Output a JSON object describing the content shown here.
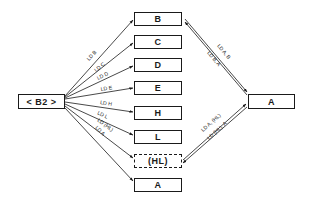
{
  "diagram": {
    "source": {
      "label": "< B2 >"
    },
    "targets": [
      {
        "label": "B",
        "edge_label": "LD B"
      },
      {
        "label": "C",
        "edge_label": "LD C"
      },
      {
        "label": "D",
        "edge_label": "LD D"
      },
      {
        "label": "E",
        "edge_label": "LD E"
      },
      {
        "label": "H",
        "edge_label": "LD H"
      },
      {
        "label": "L",
        "edge_label": "LD L"
      },
      {
        "label": "(HL)",
        "edge_label": "LD (HL)",
        "style": "dashed"
      },
      {
        "label": "A",
        "edge_label": "LD A"
      }
    ],
    "accumulator": {
      "label": "A"
    },
    "bidirectional_links": [
      {
        "between": [
          "B",
          "A"
        ],
        "labels": [
          "LD A, B",
          "LD B, A"
        ]
      },
      {
        "between": [
          "(HL)",
          "A"
        ],
        "labels": [
          "LD A, (HL)",
          "LD (HL), A"
        ]
      }
    ],
    "colors": {
      "line": "#1a1a1a",
      "background": "#ffffff"
    }
  }
}
